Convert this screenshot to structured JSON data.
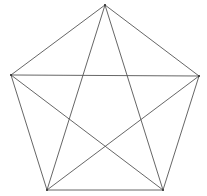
{
  "diagram": {
    "type": "pentagon-with-diagonals",
    "width": 207,
    "height": 196,
    "background": "#ffffff",
    "line_color": "#555555",
    "vertices": [
      {
        "id": "A",
        "x": 105,
        "y": 5
      },
      {
        "id": "B",
        "x": 199,
        "y": 76
      },
      {
        "id": "C",
        "x": 163,
        "y": 190
      },
      {
        "id": "D",
        "x": 47,
        "y": 190
      },
      {
        "id": "E",
        "x": 11,
        "y": 75
      }
    ],
    "edges": [
      [
        "A",
        "B"
      ],
      [
        "B",
        "C"
      ],
      [
        "C",
        "D"
      ],
      [
        "D",
        "E"
      ],
      [
        "E",
        "A"
      ]
    ],
    "diagonals": [
      [
        "A",
        "C"
      ],
      [
        "A",
        "D"
      ],
      [
        "B",
        "D"
      ],
      [
        "B",
        "E"
      ],
      [
        "C",
        "E"
      ]
    ]
  }
}
